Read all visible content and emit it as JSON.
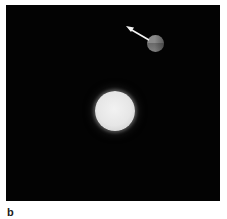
{
  "figure": {
    "panel_label": "b",
    "background_color": "#030303",
    "objects": [
      {
        "name": "central-star",
        "shape": "circle",
        "color": "#e8e8e8"
      },
      {
        "name": "planet",
        "shape": "circle",
        "color": "#808080"
      },
      {
        "name": "motion-arrow",
        "shape": "arrow",
        "color": "#ffffff",
        "direction": "up-left"
      }
    ]
  }
}
